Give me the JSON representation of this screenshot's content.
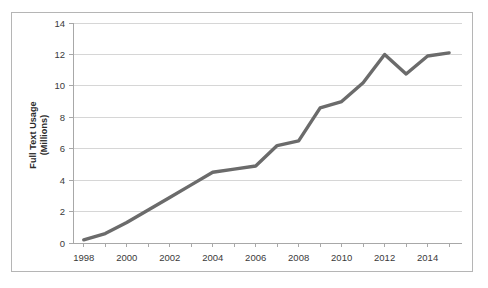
{
  "chart_data": {
    "type": "line",
    "title": "",
    "xlabel": "",
    "ylabel": "Full Text Usage (Millions)",
    "ylabel_lines": [
      "Full Text Usage",
      "(Millions)"
    ],
    "x": [
      1998,
      1999,
      2000,
      2001,
      2002,
      2003,
      2004,
      2005,
      2006,
      2007,
      2008,
      2009,
      2010,
      2011,
      2012,
      2013,
      2014,
      2015
    ],
    "values": [
      0.2,
      0.6,
      1.3,
      2.1,
      2.9,
      3.7,
      4.5,
      4.7,
      4.9,
      6.2,
      6.5,
      8.6,
      9.0,
      10.2,
      12.0,
      10.75,
      11.9,
      12.1
    ],
    "series": [
      {
        "name": "Full Text Usage",
        "values": [
          0.2,
          0.6,
          1.3,
          2.1,
          2.9,
          3.7,
          4.5,
          4.7,
          4.9,
          6.2,
          6.5,
          8.6,
          9.0,
          10.2,
          12.0,
          10.75,
          11.9,
          12.1
        ],
        "color": "#6b6b6b"
      }
    ],
    "xlim": [
      1997.5,
      2015.6
    ],
    "ylim": [
      0,
      14
    ],
    "yticks": [
      0,
      2,
      4,
      6,
      8,
      10,
      12,
      14
    ],
    "ytick_labels": [
      "0",
      "2",
      "4",
      "6",
      "8",
      "10",
      "12",
      "14"
    ],
    "xticks": [
      1998,
      1999,
      2000,
      2001,
      2002,
      2003,
      2004,
      2005,
      2006,
      2007,
      2008,
      2009,
      2010,
      2011,
      2012,
      2013,
      2014,
      2015
    ],
    "xtick_labels_shown": [
      "1998",
      "2000",
      "2002",
      "2004",
      "2006",
      "2008",
      "2010",
      "2012",
      "2014"
    ],
    "xtick_label_years": [
      1998,
      2000,
      2002,
      2004,
      2006,
      2008,
      2010,
      2012,
      2014
    ],
    "grid": "horizontal",
    "legend": "none",
    "colors": {
      "line": "#6b6b6b",
      "gridline": "#d6d6d6",
      "axis": "#a8a8a8",
      "border": "#b5b5b5",
      "background": "#ffffff",
      "text": "#3a3a3a"
    }
  }
}
